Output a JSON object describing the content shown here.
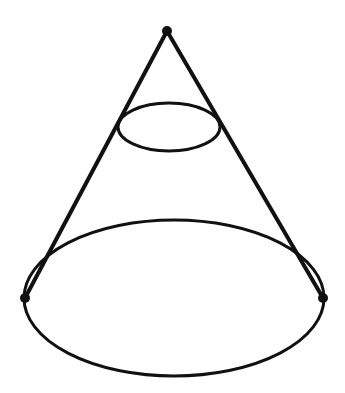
{
  "diagram": {
    "type": "cone-with-cross-section",
    "stroke_color": "#111111",
    "background": "#ffffff",
    "apex": {
      "x": 167,
      "y": 31,
      "r": 5
    },
    "base_ellipse": {
      "cx": 174,
      "cy": 298,
      "rx": 150,
      "ry": 78
    },
    "base_points": [
      {
        "x": 25,
        "y": 298,
        "r": 5
      },
      {
        "x": 323,
        "y": 298,
        "r": 5
      }
    ],
    "section_ellipse": {
      "cx": 169,
      "cy": 127,
      "rx": 51,
      "ry": 24
    }
  }
}
